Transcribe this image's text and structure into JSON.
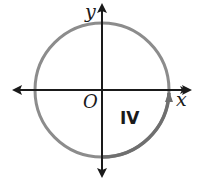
{
  "diagram": {
    "type": "unit circle on coordinate axes",
    "axes": {
      "x_label": "x",
      "y_label": "y",
      "origin_label": "O"
    },
    "quadrant_label": "IV",
    "colors": {
      "circle": "#8a8a8a",
      "highlight_arc": "#777777",
      "axes": "#1a1a1a"
    },
    "arc": {
      "description": "highlighted arc from negative y-axis counterclockwise through quadrant IV to positive x-axis, with arrowhead"
    }
  }
}
